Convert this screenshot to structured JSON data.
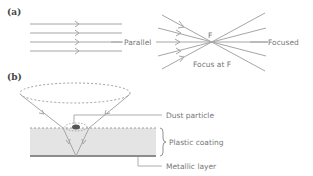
{
  "panels": [
    {
      "id": "a",
      "label": "(a)"
    },
    {
      "id": "b",
      "label": "(b)"
    }
  ],
  "panel_a": {
    "parallel_label": "Parallel",
    "focus_point_label": "F",
    "focused_label": "Focused",
    "focus_caption": "Focus at F"
  },
  "panel_b": {
    "dust_label": "Dust particle",
    "coating_label": "Plastic coating",
    "metal_label": "Metallic layer"
  },
  "colors": {
    "ray": "#a6a6a6",
    "coating_fill": "#e4e4e4",
    "metal_layer": "#8c8c8c",
    "text": "#777777"
  }
}
